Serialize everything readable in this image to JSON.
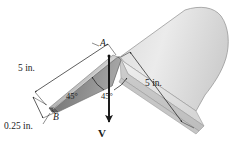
{
  "figure": {
    "background_color": "#ffffff",
    "line_color": "#1a1a1a",
    "labels": {
      "length_left": "5 in.",
      "length_right": "5 in.",
      "thickness": "0.25 in.",
      "angle_left": "45°",
      "angle_right": "45°",
      "point_a": "A",
      "point_b": "B",
      "force": "V"
    },
    "icons": {
      "force_arrow": "down-arrow-icon",
      "dimension_arrow": "dimension-arrow-icon",
      "angle_arc": "angle-arc-icon"
    },
    "colors": {
      "wedge_top_face": "#bdbdbd",
      "wedge_side_face": "#8a8a8a",
      "wedge_edge_face": "#6e6e6e",
      "plate_top_face": "#e6e6e6",
      "plate_front_face": "#d2d2d2",
      "plate_edge_face": "#c0c0c0",
      "outline": "#555555"
    }
  }
}
